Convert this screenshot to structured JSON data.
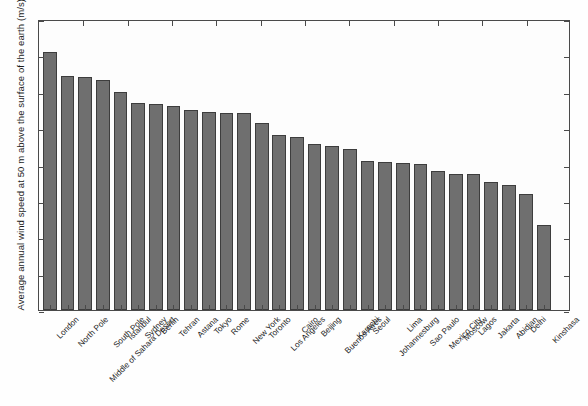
{
  "chart_data": {
    "type": "bar",
    "title": "",
    "xlabel": "",
    "ylabel": "Average annual wind speed at 50 m above the surface of the earth (m/s)",
    "ylim": [
      0,
      8
    ],
    "ytick_labels": [
      "0",
      "1",
      "2",
      "3",
      "4",
      "5",
      "6",
      "7",
      "8"
    ],
    "ytick_values": [
      0,
      1,
      2,
      3,
      4,
      5,
      6,
      7,
      8
    ],
    "grid": false,
    "legend": "none",
    "bar_color": "#6f6f6f",
    "bar_edge_color": "#3d3d3d",
    "categories": [
      "London",
      "North Pole",
      "Middle of Sahara Desert",
      "South Pole",
      "Istanbul",
      "Sydney",
      "Berlin",
      "Tehran",
      "Astana",
      "Tokyo",
      "Rome",
      "New York",
      "Toronto",
      "Los Angeles",
      "Cairo",
      "Beijing",
      "Buenos Aires",
      "Karachi",
      "Seoul",
      "Johannesburg",
      "Lima",
      "Sao Paulo",
      "Mexico City",
      "Moscow",
      "Lagos",
      "Jakarta",
      "Abidjan",
      "Delhi",
      "Kinshasa"
    ],
    "values": [
      7.08,
      6.42,
      6.4,
      6.33,
      5.98,
      5.68,
      5.67,
      5.62,
      5.5,
      5.44,
      5.42,
      5.42,
      5.15,
      4.8,
      4.75,
      4.56,
      4.52,
      4.42,
      4.1,
      4.08,
      4.04,
      4.02,
      3.83,
      3.75,
      3.73,
      3.52,
      3.45,
      3.2,
      2.35
    ]
  }
}
